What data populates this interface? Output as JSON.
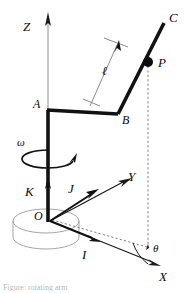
{
  "figure": {
    "kind": "mechanism-kinematics-diagram",
    "background_color": "#ffffff",
    "ink_color": "#0a0a0a",
    "thin_color": "#8c8c8c"
  },
  "labels": {
    "axis_z": "Z",
    "axis_y": "Y",
    "axis_x": "X",
    "point_c": "C",
    "point_p": "P",
    "point_a": "A",
    "point_b": "B",
    "length_ell": "ℓ",
    "omega": "ω",
    "theta": "θ",
    "unit_vector_i": "I",
    "unit_vector_j": "J",
    "unit_vector_k": "K",
    "origin": "O"
  },
  "caption": {
    "text": "Figure: rotating arm"
  },
  "geometry": {
    "origin": {
      "x": 48,
      "y": 218
    },
    "point_a": {
      "x": 48,
      "y": 110
    },
    "point_b": {
      "x": 118,
      "y": 113
    },
    "point_p": {
      "x": 148,
      "y": 62
    },
    "point_c": {
      "x": 164,
      "y": 22
    },
    "z_axis_tip": {
      "x": 48,
      "y": 14
    },
    "y_axis_tip": {
      "x": 128,
      "y": 183
    },
    "x_axis_tip": {
      "x": 158,
      "y": 266
    },
    "j_arrow_tip": {
      "x": 96,
      "y": 191
    },
    "i_arrow_tip": {
      "x": 98,
      "y": 240
    },
    "k_arrow_tip": {
      "x": 48,
      "y": 178
    },
    "base_cylinder": {
      "cx": 46,
      "cy": 221,
      "rx": 33,
      "ry": 12,
      "depth": 20
    },
    "ell_dimension": {
      "from": {
        "x": 92,
        "y": 104
      },
      "to": {
        "x": 119,
        "y": 43
      }
    },
    "omega_spin_ellipse": {
      "cx": 48,
      "cy": 158,
      "rx": 24,
      "ry": 8
    },
    "theta_arc_radius": 46,
    "projection_dashed": {
      "vertical": {
        "x": 148,
        "y1": 62,
        "y2": 247
      },
      "horizontal": {
        "x1": 50,
        "y1": 221,
        "x2": 148,
        "y2": 247
      }
    }
  }
}
